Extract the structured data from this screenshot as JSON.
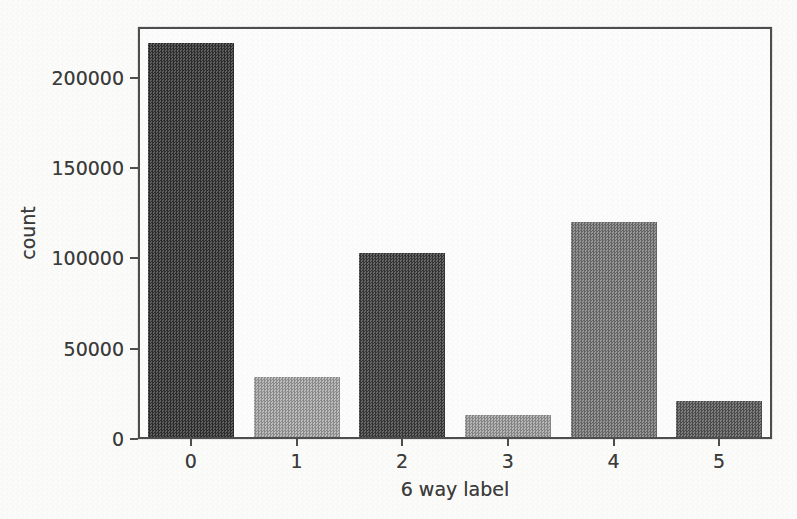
{
  "chart_data": {
    "type": "bar",
    "title": "",
    "xlabel": "6 way label",
    "ylabel": "count",
    "categories": [
      "0",
      "1",
      "2",
      "3",
      "4",
      "5"
    ],
    "values": [
      218000,
      33000,
      102000,
      12000,
      119000,
      20000
    ],
    "bar_colors": [
      "#383838",
      "#aeaeae",
      "#424242",
      "#a6a6a6",
      "#7e7e7e",
      "#5f5f5f"
    ],
    "yticks": [
      0,
      50000,
      100000,
      150000,
      200000
    ],
    "ytick_labels": [
      "0",
      "50000",
      "100000",
      "150000",
      "200000"
    ],
    "ylim": [
      0,
      228000
    ],
    "grid": false,
    "legend": "none",
    "colors": {
      "spine": "#4e4e4e",
      "text": "#3c3c3c",
      "background": "#fcfcfb"
    }
  }
}
